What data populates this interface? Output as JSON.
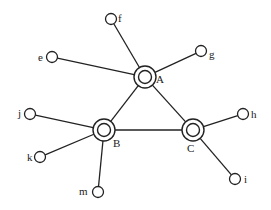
{
  "diagram": {
    "type": "network-graph",
    "hubs": [
      {
        "id": "A",
        "label": "A",
        "x": 145,
        "y": 77,
        "lx": 156,
        "ly": 83
      },
      {
        "id": "B",
        "label": "B",
        "x": 104,
        "y": 130,
        "lx": 113,
        "ly": 147
      },
      {
        "id": "C",
        "label": "C",
        "x": 193,
        "y": 130,
        "lx": 187,
        "ly": 152
      }
    ],
    "leaves": [
      {
        "id": "e",
        "label": "e",
        "x": 52,
        "y": 57,
        "lx": 38,
        "ly": 61
      },
      {
        "id": "f",
        "label": "f",
        "x": 111,
        "y": 19,
        "lx": 118,
        "ly": 22
      },
      {
        "id": "g",
        "label": "g",
        "x": 201,
        "y": 51,
        "lx": 209,
        "ly": 58
      },
      {
        "id": "j",
        "label": "j",
        "x": 30,
        "y": 114,
        "lx": 18,
        "ly": 117
      },
      {
        "id": "k",
        "label": "k",
        "x": 40,
        "y": 157,
        "lx": 27,
        "ly": 161
      },
      {
        "id": "m",
        "label": "m",
        "x": 98,
        "y": 192,
        "lx": 79,
        "ly": 195
      },
      {
        "id": "h",
        "label": "h",
        "x": 243,
        "y": 114,
        "lx": 251,
        "ly": 118
      },
      {
        "id": "i",
        "label": "i",
        "x": 235,
        "y": 179,
        "lx": 244,
        "ly": 183
      }
    ],
    "edges": [
      [
        "A",
        "B"
      ],
      [
        "A",
        "C"
      ],
      [
        "B",
        "C"
      ],
      [
        "A",
        "e"
      ],
      [
        "A",
        "f"
      ],
      [
        "A",
        "g"
      ],
      [
        "B",
        "j"
      ],
      [
        "B",
        "k"
      ],
      [
        "B",
        "m"
      ],
      [
        "C",
        "h"
      ],
      [
        "C",
        "i"
      ]
    ],
    "style": {
      "stroke": "#222222",
      "hub_outer_r": 11,
      "hub_inner_r": 6.5,
      "leaf_r": 5.5
    }
  }
}
